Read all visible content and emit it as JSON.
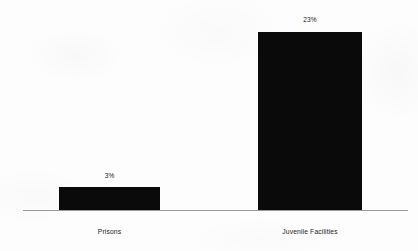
{
  "chart_data": {
    "type": "bar",
    "title": "",
    "subtitle": "",
    "xlabel": "",
    "ylabel": "",
    "categories": [
      "Prisons",
      "Juvenile Facilities"
    ],
    "values": [
      3,
      23
    ],
    "value_labels": [
      "3%",
      "23%"
    ],
    "value_unit": "%",
    "ylim": [
      0,
      23
    ],
    "grid": false,
    "legend": false,
    "legend_position": "none",
    "bar_color": "#0a0a0a",
    "axis_color": "#9a9a9a",
    "background_color": "#fdfdfd",
    "text_color": "#232323",
    "annotations": []
  },
  "chart": {
    "bars": [
      {
        "category": "Prisons",
        "value_label": "3%"
      },
      {
        "category": "Juvenile Facilities",
        "value_label": "23%"
      }
    ]
  }
}
